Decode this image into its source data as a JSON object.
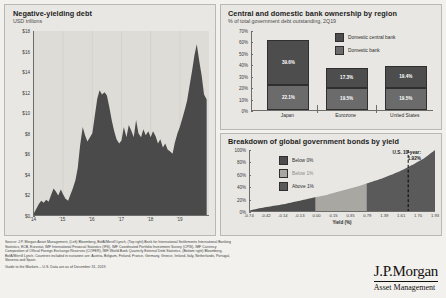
{
  "slide": {
    "source_lines": [
      "Source: J.P. Morgan Asset Management, (Left) Bloomberg, BofA/Merrill Lynch, (Top right) Bank for International Settlements International Banking",
      "Statistics, ECB, Eurostat, IMF International Financial Statistics (IFS), IMF Coordinated Portfolio Investment Survey (CPIS), IMF Currency",
      "Composition of Official Foreign Exchange Reserves (COFER), IMF-World Bank Quarterly External Debt Statistics, (Bottom right) Bloomberg,",
      "BofA/Merrill Lynch. Countries included in eurozone are: Austria, Belgium, Finland, France, Germany, Greece, Ireland, Italy, Netherlands, Portugal,",
      "Slovenia and Spain."
    ],
    "guide_line": "Guide to the Markets – U.S. Data are as of December 31, 2019.",
    "logo_main": "J.P.Morgan",
    "logo_sub": "Asset Management",
    "colors": {
      "dark": "#4d4d4d",
      "mid": "#6b6b6b",
      "light": "#a9a7a2",
      "panel": "#e8e7e3",
      "plot": "#dedcd7"
    }
  },
  "chart_data": [
    {
      "id": "negative_yielding_debt",
      "type": "area",
      "title": "Negative-yielding debt",
      "subtitle": "USD trillions",
      "xlabel": "",
      "ylabel": "USD trillions",
      "ylim": [
        0,
        18
      ],
      "yticks": [
        "$0",
        "$2",
        "$4",
        "$6",
        "$8",
        "$10",
        "$12",
        "$14",
        "$16",
        "$18"
      ],
      "ytick_values": [
        0,
        2,
        4,
        6,
        8,
        10,
        12,
        14,
        16,
        18
      ],
      "xticks": [
        "'14",
        "'15",
        "'16",
        "'17",
        "'18",
        "'19"
      ],
      "grid": true,
      "x": [
        2014.0,
        2014.08,
        2014.17,
        2014.25,
        2014.33,
        2014.42,
        2014.5,
        2014.58,
        2014.67,
        2014.75,
        2014.83,
        2014.92,
        2015.0,
        2015.08,
        2015.17,
        2015.25,
        2015.33,
        2015.42,
        2015.5,
        2015.58,
        2015.67,
        2015.75,
        2015.83,
        2015.92,
        2016.0,
        2016.08,
        2016.17,
        2016.25,
        2016.33,
        2016.42,
        2016.5,
        2016.58,
        2016.67,
        2016.75,
        2016.83,
        2016.92,
        2017.0,
        2017.08,
        2017.17,
        2017.25,
        2017.33,
        2017.42,
        2017.5,
        2017.58,
        2017.67,
        2017.75,
        2017.83,
        2017.92,
        2018.0,
        2018.08,
        2018.17,
        2018.25,
        2018.33,
        2018.42,
        2018.5,
        2018.58,
        2018.67,
        2018.75,
        2018.83,
        2018.92,
        2019.0,
        2019.08,
        2019.17,
        2019.25,
        2019.33,
        2019.42,
        2019.5,
        2019.58,
        2019.67,
        2019.75,
        2019.83,
        2019.92
      ],
      "values": [
        0.2,
        0.6,
        1.1,
        1.4,
        1.2,
        1.5,
        1.3,
        1.9,
        2.6,
        2.3,
        1.9,
        2.5,
        2.0,
        1.6,
        1.4,
        2.0,
        2.6,
        3.4,
        4.6,
        6.8,
        8.6,
        7.8,
        7.2,
        7.6,
        8.0,
        9.6,
        11.4,
        12.2,
        11.8,
        12.0,
        11.7,
        10.6,
        9.2,
        8.2,
        7.4,
        7.0,
        7.3,
        8.6,
        7.6,
        8.8,
        8.3,
        7.6,
        9.3,
        8.0,
        7.6,
        8.4,
        7.8,
        8.2,
        7.6,
        8.2,
        7.7,
        7.0,
        7.4,
        6.6,
        7.0,
        6.4,
        6.2,
        6.0,
        7.1,
        8.0,
        8.6,
        9.4,
        10.3,
        11.2,
        12.6,
        14.1,
        15.6,
        16.7,
        15.0,
        13.6,
        11.8,
        11.3
      ]
    },
    {
      "id": "bank_ownership_by_region",
      "type": "bar",
      "stacked": true,
      "title": "Central and domestic bank ownership by region",
      "subtitle": "% of total government debt outstanding, 2Q19",
      "categories": [
        "Japan",
        "Eurozone",
        "United States"
      ],
      "ylim": [
        0,
        70
      ],
      "yticks": [
        "0%",
        "10%",
        "20%",
        "30%",
        "40%",
        "50%",
        "60%",
        "70%"
      ],
      "ytick_values": [
        0,
        10,
        20,
        30,
        40,
        50,
        60,
        70
      ],
      "series": [
        {
          "name": "Domestic bank",
          "values": [
            22.1,
            19.5,
            19.5
          ],
          "labels": [
            "22.1%",
            "19.5%",
            "19.5%"
          ],
          "color": "#6b6b6b"
        },
        {
          "name": "Domestic central bank",
          "values": [
            39.6,
            17.3,
            19.4
          ],
          "labels": [
            "39.6%",
            "17.3%",
            "19.4%"
          ],
          "color": "#4d4d4d"
        }
      ],
      "totals": [
        61.7,
        36.8,
        38.9
      ],
      "legend_position": "top-right"
    },
    {
      "id": "global_bonds_by_yield",
      "type": "area",
      "cumulative": true,
      "title": "Breakdown of global government bonds by yield",
      "xlabel": "Yield (%)",
      "ylim": [
        0,
        100
      ],
      "yticks": [
        "0%",
        "20%",
        "40%",
        "60%",
        "80%",
        "100%"
      ],
      "ytick_values": [
        0,
        20,
        40,
        60,
        80,
        100
      ],
      "xticks": [
        "-0.74",
        "-0.42",
        "-0.14",
        "-0.13",
        "0.00",
        "0.15",
        "0.35",
        "0.79",
        "1.39",
        "1.61",
        "1.70",
        "1.93"
      ],
      "legend": [
        {
          "label": "Below 0%",
          "color": "#4d4d4d"
        },
        {
          "label": "Below 1%",
          "color": "#a9a7a2"
        },
        {
          "label": "Above 1%",
          "color": "#5a5a5a"
        }
      ],
      "annotation": {
        "line1": "U.S. 10-year:",
        "line2": "1.92%",
        "x_position": 0.855
      },
      "cumulative_points": [
        {
          "x": 0.0,
          "y": 1
        },
        {
          "x": 0.06,
          "y": 5
        },
        {
          "x": 0.12,
          "y": 8
        },
        {
          "x": 0.18,
          "y": 11
        },
        {
          "x": 0.24,
          "y": 15
        },
        {
          "x": 0.3,
          "y": 19
        },
        {
          "x": 0.36,
          "y": 23
        },
        {
          "x": 0.41,
          "y": 26
        },
        {
          "x": 0.47,
          "y": 31
        },
        {
          "x": 0.53,
          "y": 36
        },
        {
          "x": 0.59,
          "y": 41
        },
        {
          "x": 0.65,
          "y": 47
        },
        {
          "x": 0.71,
          "y": 53
        },
        {
          "x": 0.77,
          "y": 60
        },
        {
          "x": 0.83,
          "y": 68
        },
        {
          "x": 0.88,
          "y": 76
        },
        {
          "x": 0.94,
          "y": 86
        },
        {
          "x": 1.0,
          "y": 100
        }
      ],
      "band_breaks": [
        0.355,
        0.63
      ]
    }
  ]
}
